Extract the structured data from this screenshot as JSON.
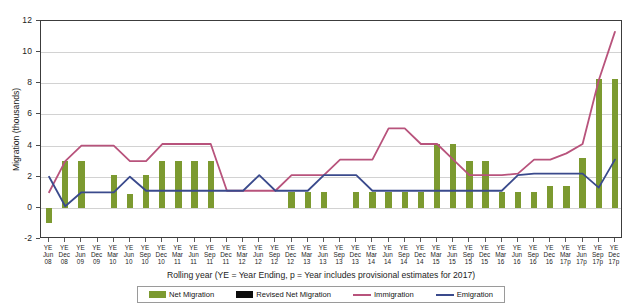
{
  "chart_data": {
    "type": "bar",
    "title": "",
    "xlabel": "Rolling year (YE = Year Ending, p = Year includes provisional estimates for 2017)",
    "ylabel": "Migration (thousands)",
    "ylim": [
      -2,
      12
    ],
    "yticks": [
      -2,
      0,
      2,
      4,
      6,
      8,
      10,
      12
    ],
    "grid": true,
    "legend_position": "bottom",
    "categories": [
      "YE Jun 08",
      "YE Dec 08",
      "YE Jun 09",
      "YE Dec 09",
      "YE Mar 10",
      "YE Jun 10",
      "YE Sep 10",
      "YE Dec 10",
      "YE Mar 11",
      "YE Jun 11",
      "YE Sep 11",
      "YE Dec 11",
      "YE Mar 12",
      "YE Jun 12",
      "YE Sep 12",
      "YE Dec 12",
      "YE Mar 13",
      "YE Jun 13",
      "YE Sep 13",
      "YE Dec 13",
      "YE Mar 14",
      "YE Jun 14",
      "YE Sep 14",
      "YE Dec 14",
      "YE Mar 15",
      "YE Jun 15",
      "YE Sep 15",
      "YE Dec 15",
      "YE Mar 16",
      "YE Jun 16",
      "YE Sep 16",
      "YE Dec 16",
      "YE Mar 17p",
      "YE Jun 17p",
      "YE Sep 17p",
      "YE Dec 17p"
    ],
    "category_lines": [
      [
        "YE",
        "Jun",
        "08"
      ],
      [
        "YE",
        "Dec",
        "08"
      ],
      [
        "YE",
        "Jun",
        "09"
      ],
      [
        "YE",
        "Dec",
        "09"
      ],
      [
        "YE",
        "Mar",
        "10"
      ],
      [
        "YE",
        "Jun",
        "10"
      ],
      [
        "YE",
        "Sep",
        "10"
      ],
      [
        "YE",
        "Dec",
        "10"
      ],
      [
        "YE",
        "Mar",
        "11"
      ],
      [
        "YE",
        "Jun",
        "11"
      ],
      [
        "YE",
        "Sep",
        "11"
      ],
      [
        "YE",
        "Dec",
        "11"
      ],
      [
        "YE",
        "Mar",
        "12"
      ],
      [
        "YE",
        "Jun",
        "12"
      ],
      [
        "YE",
        "Sep",
        "12"
      ],
      [
        "YE",
        "Dec",
        "12"
      ],
      [
        "YE",
        "Mar",
        "13"
      ],
      [
        "YE",
        "Jun",
        "13"
      ],
      [
        "YE",
        "Sep",
        "13"
      ],
      [
        "YE",
        "Dec",
        "13"
      ],
      [
        "YE",
        "Mar",
        "14"
      ],
      [
        "YE",
        "Jun",
        "14"
      ],
      [
        "YE",
        "Sep",
        "14"
      ],
      [
        "YE",
        "Dec",
        "14"
      ],
      [
        "YE",
        "Mar",
        "15"
      ],
      [
        "YE",
        "Jun",
        "15"
      ],
      [
        "YE",
        "Sep",
        "15"
      ],
      [
        "YE",
        "Dec",
        "15"
      ],
      [
        "YE",
        "Mar",
        "16"
      ],
      [
        "YE",
        "Jun",
        "16"
      ],
      [
        "YE",
        "Sep",
        "16"
      ],
      [
        "YE",
        "Dec",
        "16"
      ],
      [
        "YE",
        "Mar",
        "17p"
      ],
      [
        "YE",
        "Jun",
        "17p"
      ],
      [
        "YE",
        "Sep",
        "17p"
      ],
      [
        "YE",
        "Dec",
        "17p"
      ]
    ],
    "series": [
      {
        "name": "Net Migration",
        "kind": "bar",
        "color": "#7c9a30",
        "values": [
          -1,
          3,
          3,
          null,
          2.1,
          0.9,
          2.1,
          3,
          3,
          3,
          3,
          null,
          null,
          null,
          null,
          1,
          1,
          1,
          null,
          1,
          1,
          1,
          1,
          1,
          4.1,
          4.1,
          3,
          3,
          1,
          1,
          1,
          1.4,
          1.4,
          3.2,
          8.3,
          8.3
        ]
      },
      {
        "name": "Revised Net Migration",
        "kind": "bar",
        "color": "#0d0d0d",
        "values": [
          null,
          null,
          null,
          null,
          null,
          null,
          null,
          null,
          null,
          null,
          null,
          null,
          null,
          null,
          null,
          null,
          null,
          null,
          null,
          null,
          null,
          null,
          null,
          null,
          null,
          null,
          null,
          null,
          null,
          null,
          null,
          null,
          null,
          null,
          null,
          null
        ]
      },
      {
        "name": "Immigration",
        "kind": "line",
        "color": "#b8537c",
        "values": [
          1,
          3,
          4,
          4,
          4,
          3,
          3,
          4.1,
          4.1,
          4.1,
          4.1,
          1.1,
          1.1,
          1.1,
          1.1,
          2.1,
          2.1,
          2.1,
          3.1,
          3.1,
          3.1,
          5.1,
          5.1,
          4.1,
          4.1,
          3.1,
          2.1,
          2.1,
          2.1,
          2.2,
          3.1,
          3.1,
          3.5,
          4.1,
          8.2,
          11.3
        ]
      },
      {
        "name": "Emigration",
        "kind": "line",
        "color": "#3a4a8c",
        "values": [
          2,
          0.1,
          1,
          1,
          1,
          2,
          1.1,
          1.1,
          1.1,
          1.1,
          1.1,
          1.1,
          1.1,
          2.1,
          1.1,
          1.1,
          1.1,
          2.1,
          2.1,
          2.1,
          1.1,
          1.1,
          1.1,
          1.1,
          1.1,
          1.1,
          1.1,
          1.1,
          1.1,
          2.1,
          2.2,
          2.2,
          2.2,
          2.2,
          1.3,
          3.1
        ]
      }
    ]
  },
  "legend": {
    "items": [
      {
        "label": "Net Migration",
        "marker": "bar-green"
      },
      {
        "label": "Revised Net Migration",
        "marker": "bar-black"
      },
      {
        "label": "Immigration",
        "marker": "line-pink"
      },
      {
        "label": "Emigration",
        "marker": "line-navy"
      }
    ]
  }
}
